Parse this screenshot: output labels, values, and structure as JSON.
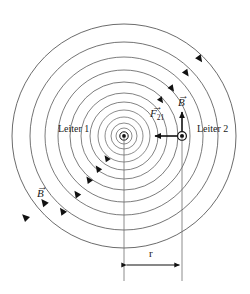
{
  "figure": {
    "type": "physics-diagram",
    "background_color": "#ffffff",
    "line_color": "#555555",
    "ink_color": "#1a1a1a",
    "labels": {
      "conductor_1": "Leiter 1",
      "conductor_2": "Leiter 2",
      "force_vector": "F",
      "force_vector_subscript": "21",
      "b_field_right": "B",
      "b_field_left": "B",
      "distance": "r",
      "vector_bar": "→"
    },
    "caption": "",
    "geometry": {
      "center_x": 124,
      "center_y": 136,
      "conductor2_x": 182,
      "conductor2_y": 136,
      "field_circle_radii": [
        8,
        13,
        19,
        26,
        34,
        43,
        54,
        66,
        79,
        94,
        112
      ],
      "outer_circle_right_edge_x": 237,
      "dimension_line_y": 265,
      "extension_line_top_y": 136,
      "extension_line_bottom_y": 280
    },
    "symbols": {
      "current_direction": "out-of-page-dot",
      "field_rotation": "counterclockwise",
      "force_direction": "leftward-attractive"
    },
    "label_positions": {
      "conductor_1": {
        "x": 58,
        "y": 125
      },
      "conductor_2": {
        "x": 197,
        "y": 125
      },
      "force_vector": {
        "x": 152,
        "y": 110
      },
      "b_field_right": {
        "x": 179,
        "y": 95
      },
      "b_field_left": {
        "x": 38,
        "y": 186
      },
      "distance": {
        "x": 148,
        "y": 248
      }
    }
  }
}
